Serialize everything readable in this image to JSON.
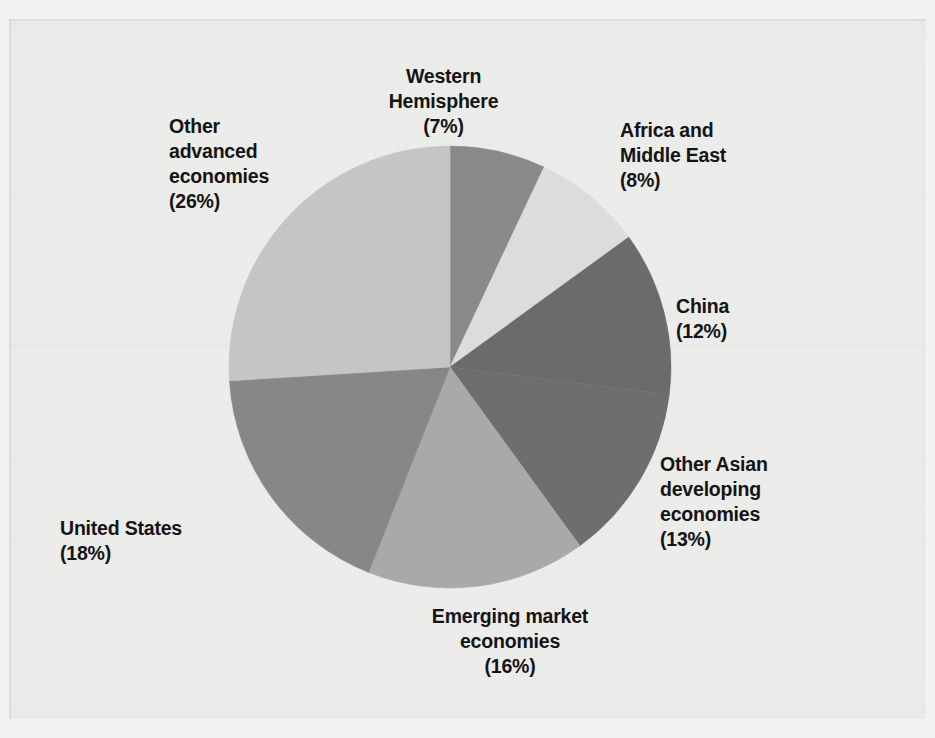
{
  "figure": {
    "background_color": "#eeeeec",
    "page_color": "#f2f2f0"
  },
  "chart_data": {
    "type": "pie",
    "title": "",
    "subtitle": "",
    "xlabel": "",
    "ylabel": "",
    "legend_position": "outside-labels",
    "grid": false,
    "units": "percent",
    "total": 100,
    "start_angle_deg": 0,
    "direction": "clockwise",
    "categories": [
      "Western Hemisphere",
      "Africa and Middle East",
      "China",
      "Other Asian developing economies",
      "Emerging market economies",
      "United States",
      "Other advanced economies"
    ],
    "values": [
      7,
      8,
      12,
      13,
      16,
      18,
      26
    ],
    "colors": [
      "#8a8a8a",
      "#dcdcda",
      "#6b6b6b",
      "#6e6e6e",
      "#a9a9a9",
      "#878787",
      "#c5c5c3"
    ],
    "slices": [
      {
        "name": "Western Hemisphere",
        "value": 7,
        "value_label": "(7%)",
        "label_line1": "Western",
        "label_line2": "Hemisphere",
        "color": "#8a8a8a",
        "start_deg": 0,
        "end_deg": 25.2
      },
      {
        "name": "Africa and Middle East",
        "value": 8,
        "value_label": "(8%)",
        "label_line1": "Africa and",
        "label_line2": "Middle East",
        "color": "#dcdcda",
        "start_deg": 25.2,
        "end_deg": 54.0
      },
      {
        "name": "China",
        "value": 12,
        "value_label": "(12%)",
        "label_line1": "China",
        "label_line2": "",
        "color": "#6b6b6b",
        "start_deg": 54.0,
        "end_deg": 97.2
      },
      {
        "name": "Other Asian developing economies",
        "value": 13,
        "value_label": "(13%)",
        "label_line1": "Other Asian",
        "label_line2": "developing",
        "label_line3": "economies",
        "color": "#6e6e6e",
        "start_deg": 97.2,
        "end_deg": 144.0
      },
      {
        "name": "Emerging market economies",
        "value": 16,
        "value_label": "(16%)",
        "label_line1": "Emerging market",
        "label_line2": "economies",
        "color": "#a9a9a9",
        "start_deg": 144.0,
        "end_deg": 201.6
      },
      {
        "name": "United States",
        "value": 18,
        "value_label": "(18%)",
        "label_line1": "United States",
        "label_line2": "",
        "color": "#878787",
        "start_deg": 201.6,
        "end_deg": 266.4
      },
      {
        "name": "Other advanced economies",
        "value": 26,
        "value_label": "(26%)",
        "label_line1": "Other",
        "label_line2": "advanced",
        "label_line3": "economies",
        "color": "#c5c5c3",
        "start_deg": 266.4,
        "end_deg": 360.0
      }
    ]
  },
  "labels": {
    "western_hemisphere": "Western\nHemisphere\n(7%)",
    "africa_middle_east": "Africa and\nMiddle East\n(8%)",
    "china": "China\n(12%)",
    "other_asian_developing": "Other Asian\ndeveloping\neconomies\n(13%)",
    "emerging_market": "Emerging market\neconomies\n(16%)",
    "united_states": "United States\n(18%)",
    "other_advanced": "Other\nadvanced\neconomies\n(26%)"
  }
}
